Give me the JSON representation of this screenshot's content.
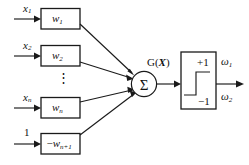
{
  "figure": {
    "colors": {
      "stroke": "#1a1a1a",
      "background": "#ffffff",
      "text": "#111111"
    }
  },
  "inputs": [
    {
      "id": "input-1",
      "signal_base": "x",
      "signal_sub": "1",
      "weight_base": "w",
      "weight_sub": "1",
      "weight_sign": ""
    },
    {
      "id": "input-2",
      "signal_base": "x",
      "signal_sub": "2",
      "weight_base": "w",
      "weight_sub": "2",
      "weight_sign": ""
    },
    {
      "id": "input-n",
      "signal_base": "x",
      "signal_sub": "n",
      "weight_base": "w",
      "weight_sub": "n",
      "weight_sign": ""
    },
    {
      "id": "input-bias",
      "signal_base": "1",
      "signal_sub": "",
      "weight_base": "w",
      "weight_sub": "n+1",
      "weight_sign": "−"
    }
  ],
  "ellipsis": {
    "glyph": "⋮"
  },
  "summation": {
    "glyph": "Σ",
    "output_label_base": "G(",
    "output_label_var": "X",
    "output_label_close": ")"
  },
  "activation": {
    "name": "hard-limiter-step-function",
    "high_label": "+1",
    "low_label": "−1"
  },
  "outputs": [
    {
      "id": "class-1",
      "base": "ω",
      "sub": "1"
    },
    {
      "id": "class-2",
      "base": "ω",
      "sub": "2"
    }
  ]
}
